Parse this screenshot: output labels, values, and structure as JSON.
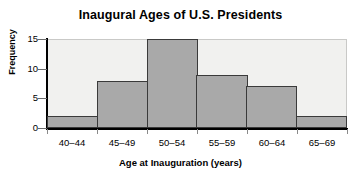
{
  "chart_data": {
    "type": "bar",
    "title": "Inaugural Ages of U.S. Presidents",
    "xlabel": "Age at Inauguration (years)",
    "ylabel": "Frequency",
    "categories": [
      "40–44",
      "45–49",
      "50–54",
      "55–59",
      "60–64",
      "65–69"
    ],
    "values": [
      2,
      8,
      15,
      9,
      7,
      2
    ],
    "ylim": [
      0,
      15
    ],
    "yticks": [
      0,
      5,
      10,
      15
    ],
    "ytick_labels": [
      "0",
      "5",
      "10",
      "15"
    ],
    "grid": false,
    "legend": "none",
    "colors": {
      "bar_fill": "#a9a9a9",
      "bar_edge": "#3a3a3a",
      "plot_background": "#f1f1ef",
      "axis": "#000000",
      "text": "#000000"
    }
  }
}
